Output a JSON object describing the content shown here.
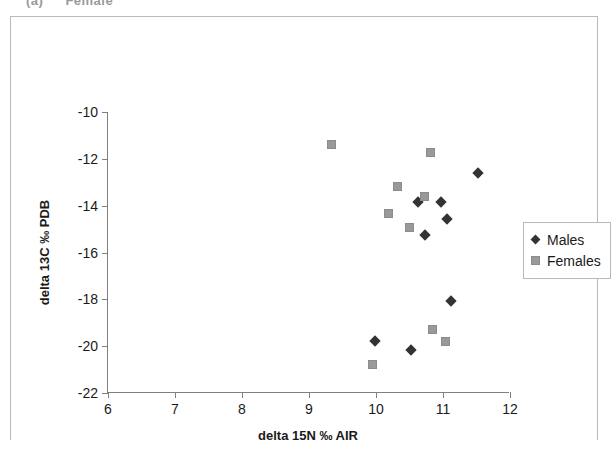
{
  "caption": {
    "number": "(a)",
    "text": "Female"
  },
  "chart_data": {
    "type": "scatter",
    "title": "",
    "xlabel": "delta 15N ‰ AIR",
    "ylabel": "delta 13C ‰ PDB",
    "xlim": [
      6,
      12
    ],
    "ylim": [
      -22,
      -10
    ],
    "xticks": [
      6,
      7,
      8,
      9,
      10,
      11,
      12
    ],
    "yticks": [
      -10,
      -12,
      -14,
      -16,
      -18,
      -20,
      -22
    ],
    "xtick_labels": [
      "6",
      "7",
      "8",
      "9",
      "10",
      "11",
      "12"
    ],
    "ytick_labels": [
      "-10",
      "-12",
      "-14",
      "-16",
      "-18",
      "-20",
      "-22"
    ],
    "grid": false,
    "legend_position": "right",
    "series": [
      {
        "name": "Males",
        "marker": "diamond",
        "color": "#333333",
        "points": [
          {
            "x": 11.52,
            "y": -12.6
          },
          {
            "x": 10.62,
            "y": -13.85
          },
          {
            "x": 10.97,
            "y": -13.85
          },
          {
            "x": 11.06,
            "y": -14.55
          },
          {
            "x": 10.73,
            "y": -15.25
          },
          {
            "x": 11.12,
            "y": -18.05
          },
          {
            "x": 10.52,
            "y": -20.15
          },
          {
            "x": 9.98,
            "y": -19.8
          }
        ]
      },
      {
        "name": "Females",
        "marker": "square",
        "color": "#999999",
        "points": [
          {
            "x": 9.33,
            "y": -11.4
          },
          {
            "x": 10.82,
            "y": -11.75
          },
          {
            "x": 10.32,
            "y": -13.2
          },
          {
            "x": 10.72,
            "y": -13.6
          },
          {
            "x": 10.18,
            "y": -14.35
          },
          {
            "x": 10.5,
            "y": -14.95
          },
          {
            "x": 10.85,
            "y": -19.3
          },
          {
            "x": 11.03,
            "y": -19.8
          },
          {
            "x": 9.95,
            "y": -20.8
          }
        ]
      }
    ]
  },
  "legend": {
    "items": [
      {
        "label": "Males",
        "marker": "diamond"
      },
      {
        "label": "Females",
        "marker": "square"
      }
    ]
  }
}
